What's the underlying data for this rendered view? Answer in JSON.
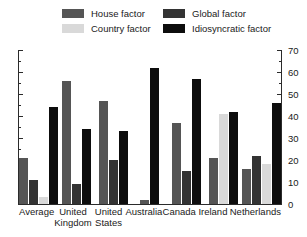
{
  "legend": {
    "items": [
      {
        "label": "House factor",
        "color": "#555555",
        "key": "house"
      },
      {
        "label": "Global factor",
        "color": "#333333",
        "key": "global"
      },
      {
        "label": "Country factor",
        "color": "#d9d9d9",
        "key": "country"
      },
      {
        "label": "Idiosyncratic factor",
        "color": "#0d0d0d",
        "key": "idiosyncratic"
      }
    ]
  },
  "axis": {
    "y_ticks": [
      "0",
      "10",
      "20",
      "30",
      "40",
      "50",
      "60",
      "70"
    ],
    "y_min": 0,
    "y_max": 70,
    "y_minor_step": 5,
    "y_side": "right"
  },
  "chart_data": {
    "type": "bar",
    "title": "",
    "xlabel": "",
    "ylabel": "",
    "ylim": [
      0,
      70
    ],
    "grid": false,
    "legend_position": "top",
    "categories": [
      "Average",
      "United Kingdom",
      "United States",
      "Australia",
      "Canada",
      "Ireland",
      "Netherlands"
    ],
    "series": [
      {
        "name": "House factor",
        "color": "#555555",
        "values": [
          21,
          56,
          47,
          2,
          37,
          21,
          16
        ]
      },
      {
        "name": "Global factor",
        "color": "#333333",
        "values": [
          11,
          9,
          20,
          0,
          15,
          0,
          22
        ]
      },
      {
        "name": "Country factor",
        "color": "#d9d9d9",
        "values": [
          3,
          0,
          0,
          0,
          0,
          41,
          18
        ]
      },
      {
        "name": "Idiosyncratic factor",
        "color": "#0d0d0d",
        "values": [
          44,
          34,
          33,
          62,
          57,
          42,
          46
        ]
      }
    ]
  }
}
